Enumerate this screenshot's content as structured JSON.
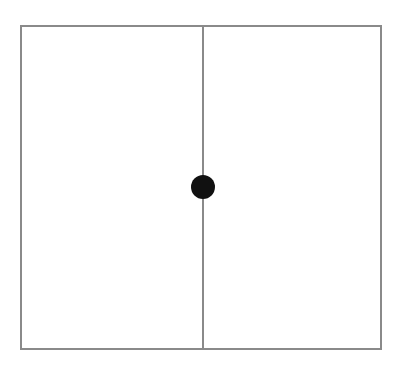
{
  "diagram": {
    "frame": {
      "shape": "rectangle",
      "stroke_color": "#8a8a8a",
      "fill_color": "#ffffff"
    },
    "divider": {
      "orientation": "vertical",
      "position": "center",
      "stroke_color": "#8a8a8a"
    },
    "dot": {
      "shape": "circle",
      "position": "center",
      "fill_color": "#111111"
    },
    "panels": [
      {
        "name": "left-panel"
      },
      {
        "name": "right-panel"
      }
    ]
  }
}
